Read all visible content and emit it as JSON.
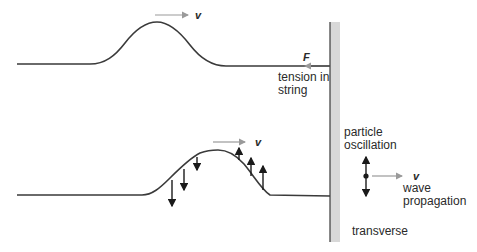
{
  "diagram": {
    "top_panel": {
      "velocity_label": "v",
      "force_label": "F",
      "tension_label_line1": "tension in",
      "tension_label_line2": "string"
    },
    "bottom_panel": {
      "velocity_label": "v",
      "particle_label_line1": "particle",
      "particle_label_line2": "oscillation",
      "wave_velocity_label": "v",
      "wave_label_line1": "wave",
      "wave_label_line2": "propagation",
      "type_label": "transverse"
    },
    "colors": {
      "string": "#3a3a3a",
      "wall": "#d8d8d8",
      "velocity_arrow": "#9a9a9a",
      "particle_arrow": "#1a1a1a"
    }
  }
}
